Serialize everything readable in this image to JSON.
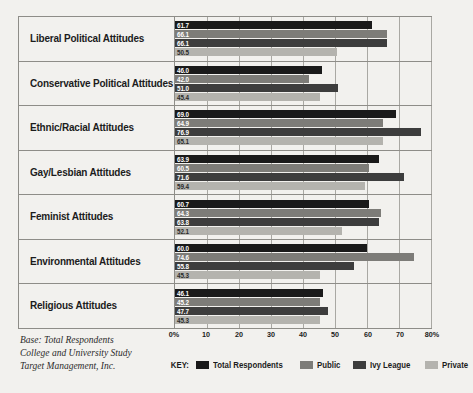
{
  "chart_data": {
    "type": "bar",
    "orientation": "horizontal",
    "title": "",
    "xlabel": "",
    "ylabel": "",
    "xlim": [
      0,
      80
    ],
    "grid": true,
    "legend_position": "bottom",
    "xticks": [
      "0%",
      "10",
      "20",
      "30",
      "40",
      "50",
      "60",
      "70",
      "80%"
    ],
    "xtick_values": [
      0,
      10,
      20,
      30,
      40,
      50,
      60,
      70,
      80
    ],
    "categories": [
      "Liberal Political Attitudes",
      "Conservative Political Attitudes",
      "Ethnic/Racial Attitudes",
      "Gay/Lesbian Attitudes",
      "Feminist Attitudes",
      "Environmental Attitudes",
      "Religious Attitudes"
    ],
    "series": [
      {
        "name": "Total Respondents",
        "color": "#1a1a1a",
        "values": [
          61.7,
          46.0,
          69.0,
          63.9,
          60.7,
          60.0,
          46.1
        ]
      },
      {
        "name": "Public",
        "color": "#7d7c78",
        "values": [
          66.1,
          42.0,
          64.9,
          60.5,
          64.3,
          74.6,
          45.2
        ]
      },
      {
        "name": "Ivy League",
        "color": "#3d3d3d",
        "values": [
          66.1,
          51.0,
          76.9,
          71.6,
          63.8,
          55.8,
          47.7
        ]
      },
      {
        "name": "Private",
        "color": "#b4b3ae",
        "values": [
          50.5,
          45.4,
          65.1,
          59.4,
          52.1,
          45.3,
          45.3
        ]
      }
    ]
  },
  "legend": {
    "key_label": "KEY:"
  },
  "footnote": {
    "line1": "Base: Total Respondents",
    "line2": "College and University Study",
    "line3": "Target Management, Inc."
  }
}
